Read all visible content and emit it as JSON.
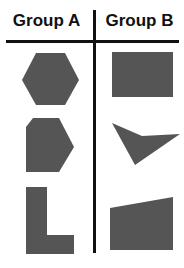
{
  "colors": {
    "background": "#ffffff",
    "shape_fill": "#555555",
    "divider": "#111111",
    "header_text": "#111111"
  },
  "headers": {
    "group_a": "Group A",
    "group_b": "Group B"
  },
  "dividers": {
    "vertical": {
      "x": 93,
      "y": 10,
      "width": 3,
      "height": 243
    },
    "horizontal": {
      "x": 6,
      "y": 40,
      "width": 173,
      "height": 3
    }
  },
  "shapes": [
    {
      "group": "A",
      "name": "hexagon",
      "points": "36,53 65,53 79,80 65,105 36,105 22,80"
    },
    {
      "group": "A",
      "name": "pentagon-cut-corner",
      "points": "33,118 59,118 74,147 59,172 26,172 26,127"
    },
    {
      "group": "A",
      "name": "l-shape",
      "points": "26,187 47,187 47,235 74,235 74,254 26,254"
    },
    {
      "group": "B",
      "name": "rectangle",
      "points": "112,52 173,52 173,97 112,97"
    },
    {
      "group": "B",
      "name": "concave-dart",
      "points": "112,123 142,136 180,134 135,165"
    },
    {
      "group": "B",
      "name": "slanted-quadrilateral",
      "points": "110,208 173,197 173,250 110,250"
    }
  ]
}
